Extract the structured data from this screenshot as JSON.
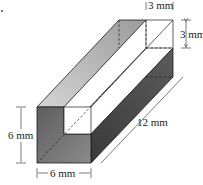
{
  "figure": {
    "type": "3D prism with square notch removed",
    "dimensions": {
      "notch_width": "3 mm",
      "notch_height": "3 mm",
      "length": "12 mm",
      "front_height": "6 mm",
      "front_width": "6 mm"
    },
    "colors": {
      "front_face": "#6e6e6e",
      "right_face": "#4a4a4a",
      "top_face": "#b5b5b5",
      "notch_face": "#ffffff",
      "edge": "#1a1a1a"
    }
  }
}
